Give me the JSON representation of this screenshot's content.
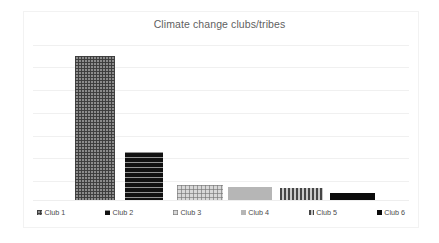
{
  "chart_data": {
    "type": "bar",
    "title": "Climate change clubs/tribes",
    "xlabel": "",
    "ylabel": "",
    "categories": [
      "Club 1",
      "Club 2",
      "Club 3",
      "Club 4",
      "Club 5",
      "Club 6"
    ],
    "values": [
      93,
      31,
      10,
      8.5,
      8,
      4.5
    ],
    "ylim": [
      0,
      100
    ],
    "grid": true,
    "gridline_count": 7,
    "legend_position": "bottom",
    "legend": [
      "Club 1",
      "Club 2",
      "Club 3",
      "Club 4",
      "Club 5",
      "Club 6"
    ],
    "series": [
      {
        "name": "Clubs",
        "values": [
          93,
          31,
          10,
          8.5,
          8,
          4.5
        ]
      }
    ],
    "bars": [
      {
        "label": "Club 1",
        "value": 93,
        "pattern": "crosshatch-dark",
        "color": "#8c8c8c"
      },
      {
        "label": "Club 2",
        "value": 31,
        "pattern": "horizontal-stripe-black",
        "color": "#111111"
      },
      {
        "label": "Club 3",
        "value": 10,
        "pattern": "checker-light",
        "color": "#d8d8d8"
      },
      {
        "label": "Club 4",
        "value": 8.5,
        "pattern": "solid-gray",
        "color": "#b6b6b6"
      },
      {
        "label": "Club 5",
        "value": 8,
        "pattern": "vertical-stripe-gray",
        "color": "#c9c9c9"
      },
      {
        "label": "Club 6",
        "value": 4.5,
        "pattern": "solid-black",
        "color": "#0b0b0b"
      }
    ]
  },
  "colors": {
    "background": "#ffffff",
    "frame": "#f2f2f2",
    "gridline": "#f0f0f0",
    "title_text": "#5f5f5f",
    "legend_text": "#4a4a4a"
  }
}
